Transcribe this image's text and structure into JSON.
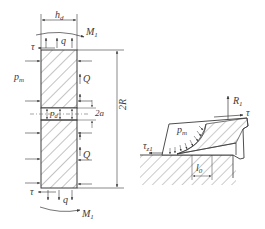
{
  "figure": {
    "left_panel": {
      "title": "seal ring cross-section force diagram",
      "labels": {
        "h_d": {
          "main": "h",
          "sub": "d"
        },
        "M1_top": {
          "main": "M",
          "sub": "1"
        },
        "M1_bottom": {
          "main": "M",
          "sub": "1"
        },
        "tau_top": "τ",
        "tau_bottom": "τ",
        "q_top": "q",
        "q_bottom": "q",
        "p_m": {
          "main": "p",
          "sub": "m"
        },
        "Q_top": "Q",
        "Q_bottom": "Q",
        "p_d": {
          "main": "p",
          "sub": "d"
        },
        "two_a": "2a",
        "two_R": "2R"
      }
    },
    "right_panel": {
      "title": "seal contact detail",
      "labels": {
        "R1": {
          "main": "R",
          "sub": "1"
        },
        "tau": "τ",
        "p_m": {
          "main": "p",
          "sub": "m"
        },
        "tau_z1": {
          "main": "τ",
          "sub": "z1"
        },
        "l0": {
          "main": "l",
          "sub": "0"
        }
      }
    },
    "colors": {
      "line": "#3a3a3a",
      "hatch": "#6a6a6a",
      "background": "#ffffff"
    }
  }
}
